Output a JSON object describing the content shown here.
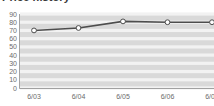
{
  "chart_title": "Price history",
  "chart_data": {
    "type": "line",
    "title": "Price history",
    "xlabel": "",
    "ylabel": "",
    "categories": [
      "6/03",
      "6/04",
      "6/05",
      "6/06",
      "6/07"
    ],
    "values": [
      70,
      73,
      81,
      80,
      80
    ],
    "series": [
      {
        "name": "Price",
        "values": [
          70,
          73,
          81,
          80,
          80
        ]
      }
    ],
    "ylim": [
      0,
      90
    ],
    "ytick_labels": [
      "90",
      "80",
      "70",
      "60",
      "50",
      "40",
      "30",
      "20",
      "10",
      "0"
    ],
    "ytick_values": [
      90,
      80,
      70,
      60,
      50,
      40,
      30,
      20,
      10,
      0
    ],
    "grid": true,
    "grid_orientation": "horizontal",
    "legend": false,
    "legend_position": "none",
    "marker": "open-circle",
    "line_color": "#4d4d4d",
    "marker_fill": "#ffffff",
    "marker_edge": "#4d4d4d",
    "plot_background": "#d9d9d9",
    "gridline_color": "#f2f2f2",
    "tick_label_color": "#6b6b6b",
    "title_color": "#3a3a3a"
  }
}
